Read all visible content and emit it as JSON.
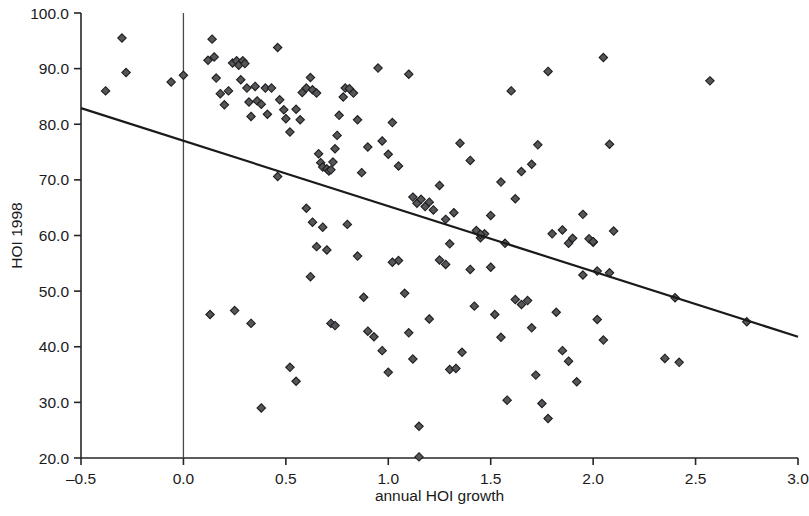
{
  "chart_data": {
    "type": "scatter",
    "title": "",
    "subtitle": "",
    "xlabel": "annual HOI growth",
    "ylabel": "HOI 1998",
    "xlim": [
      -0.5,
      3.0
    ],
    "ylim": [
      20.0,
      100.0
    ],
    "xticks": [
      -0.5,
      0.0,
      0.5,
      1.0,
      1.5,
      2.0,
      2.5,
      3.0
    ],
    "xticklabels": [
      "–0.5",
      "0.0",
      "0.5",
      "1.0",
      "1.5",
      "2.0",
      "2.5",
      "3.0"
    ],
    "yticks": [
      20.0,
      30.0,
      40.0,
      50.0,
      60.0,
      70.0,
      80.0,
      90.0,
      100.0
    ],
    "yticklabels": [
      "20.0",
      "30.0",
      "40.0",
      "50.0",
      "60.0",
      "70.0",
      "80.0",
      "90.0",
      "100.0"
    ],
    "grid": false,
    "legend": null,
    "legend_position": "none",
    "marker_shape": "diamond",
    "marker_color": "#55565a",
    "marker_edge_color": "#1d1d1f",
    "annotations": [
      {
        "name": "vertical-reference-line",
        "type": "vline",
        "x": 0.0,
        "color": "#4a4a4a"
      }
    ],
    "trendline": {
      "name": "linear-fit",
      "type": "line",
      "color": "#1a1a1a",
      "x": [
        -0.5,
        3.0
      ],
      "y": [
        82.9,
        41.8
      ],
      "slope": -11.74,
      "intercept": 77.03
    },
    "series": [
      {
        "name": "countries",
        "marker": "diamond",
        "points": [
          [
            -0.38,
            86.0
          ],
          [
            -0.3,
            95.5
          ],
          [
            -0.28,
            89.3
          ],
          [
            -0.06,
            87.6
          ],
          [
            0.0,
            88.8
          ],
          [
            0.12,
            91.5
          ],
          [
            0.14,
            95.3
          ],
          [
            0.15,
            92.1
          ],
          [
            0.16,
            88.3
          ],
          [
            0.18,
            85.5
          ],
          [
            0.2,
            83.5
          ],
          [
            0.22,
            86.0
          ],
          [
            0.24,
            91.0
          ],
          [
            0.26,
            91.4
          ],
          [
            0.27,
            90.6
          ],
          [
            0.28,
            88.0
          ],
          [
            0.29,
            91.4
          ],
          [
            0.3,
            90.9
          ],
          [
            0.31,
            86.5
          ],
          [
            0.32,
            84.0
          ],
          [
            0.33,
            81.4
          ],
          [
            0.35,
            86.8
          ],
          [
            0.36,
            84.2
          ],
          [
            0.38,
            83.6
          ],
          [
            0.4,
            86.5
          ],
          [
            0.41,
            81.8
          ],
          [
            0.43,
            86.5
          ],
          [
            0.46,
            93.8
          ],
          [
            0.47,
            84.4
          ],
          [
            0.49,
            82.6
          ],
          [
            0.5,
            81.0
          ],
          [
            0.52,
            78.6
          ],
          [
            0.55,
            82.7
          ],
          [
            0.57,
            80.8
          ],
          [
            0.58,
            85.7
          ],
          [
            0.6,
            86.5
          ],
          [
            0.62,
            88.4
          ],
          [
            0.63,
            86.2
          ],
          [
            0.65,
            85.6
          ],
          [
            0.66,
            74.7
          ],
          [
            0.67,
            73.1
          ],
          [
            0.68,
            72.3
          ],
          [
            0.7,
            72.0
          ],
          [
            0.71,
            71.6
          ],
          [
            0.72,
            71.8
          ],
          [
            0.73,
            73.2
          ],
          [
            0.74,
            75.6
          ],
          [
            0.75,
            78.0
          ],
          [
            0.76,
            81.6
          ],
          [
            0.78,
            84.9
          ],
          [
            0.79,
            86.5
          ],
          [
            0.81,
            86.4
          ],
          [
            0.83,
            85.6
          ],
          [
            0.85,
            80.8
          ],
          [
            0.87,
            71.3
          ],
          [
            0.9,
            75.9
          ],
          [
            0.95,
            90.1
          ],
          [
            0.97,
            77.0
          ],
          [
            1.0,
            74.6
          ],
          [
            1.02,
            80.3
          ],
          [
            1.05,
            72.5
          ],
          [
            1.1,
            89.0
          ],
          [
            1.12,
            66.9
          ],
          [
            1.14,
            65.8
          ],
          [
            1.16,
            66.5
          ],
          [
            1.18,
            65.2
          ],
          [
            1.2,
            66.0
          ],
          [
            1.22,
            64.6
          ],
          [
            1.25,
            69.0
          ],
          [
            1.28,
            62.9
          ],
          [
            1.32,
            64.1
          ],
          [
            1.35,
            76.6
          ],
          [
            1.4,
            73.5
          ],
          [
            1.43,
            60.9
          ],
          [
            1.45,
            59.6
          ],
          [
            1.47,
            60.3
          ],
          [
            1.5,
            63.6
          ],
          [
            1.55,
            69.6
          ],
          [
            1.57,
            58.6
          ],
          [
            1.6,
            86.0
          ],
          [
            1.62,
            66.6
          ],
          [
            1.65,
            71.5
          ],
          [
            1.7,
            72.8
          ],
          [
            1.73,
            76.3
          ],
          [
            1.78,
            89.5
          ],
          [
            1.8,
            60.3
          ],
          [
            1.85,
            61.0
          ],
          [
            1.88,
            58.6
          ],
          [
            1.9,
            59.5
          ],
          [
            1.95,
            63.8
          ],
          [
            2.0,
            58.8
          ],
          [
            2.02,
            53.6
          ],
          [
            2.05,
            92.0
          ],
          [
            2.08,
            76.4
          ],
          [
            2.1,
            60.8
          ],
          [
            2.4,
            48.8
          ],
          [
            2.57,
            87.8
          ],
          [
            2.75,
            44.5
          ],
          [
            0.13,
            45.8
          ],
          [
            0.25,
            46.5
          ],
          [
            0.33,
            44.2
          ],
          [
            0.38,
            29.0
          ],
          [
            0.52,
            36.3
          ],
          [
            0.55,
            33.8
          ],
          [
            0.62,
            52.6
          ],
          [
            0.63,
            62.4
          ],
          [
            0.65,
            58.0
          ],
          [
            0.68,
            61.5
          ],
          [
            0.7,
            57.4
          ],
          [
            0.72,
            44.2
          ],
          [
            0.74,
            43.8
          ],
          [
            0.8,
            62.0
          ],
          [
            0.85,
            56.3
          ],
          [
            0.88,
            48.9
          ],
          [
            0.9,
            42.8
          ],
          [
            0.93,
            41.8
          ],
          [
            0.97,
            39.3
          ],
          [
            1.0,
            35.4
          ],
          [
            1.05,
            55.5
          ],
          [
            1.08,
            49.6
          ],
          [
            1.1,
            42.5
          ],
          [
            1.12,
            37.8
          ],
          [
            1.15,
            25.7
          ],
          [
            1.15,
            20.2
          ],
          [
            1.2,
            45.0
          ],
          [
            1.25,
            55.6
          ],
          [
            1.28,
            54.8
          ],
          [
            1.3,
            35.9
          ],
          [
            1.33,
            36.1
          ],
          [
            1.36,
            39.0
          ],
          [
            1.4,
            53.9
          ],
          [
            1.42,
            47.3
          ],
          [
            1.45,
            60.2
          ],
          [
            1.5,
            54.3
          ],
          [
            1.52,
            45.8
          ],
          [
            1.55,
            41.7
          ],
          [
            1.58,
            30.4
          ],
          [
            1.62,
            48.5
          ],
          [
            1.65,
            47.6
          ],
          [
            1.68,
            48.3
          ],
          [
            1.7,
            43.4
          ],
          [
            1.72,
            34.9
          ],
          [
            1.75,
            29.8
          ],
          [
            1.78,
            27.1
          ],
          [
            1.82,
            46.2
          ],
          [
            1.85,
            39.3
          ],
          [
            1.88,
            37.4
          ],
          [
            1.92,
            33.7
          ],
          [
            1.95,
            52.9
          ],
          [
            1.98,
            59.4
          ],
          [
            2.0,
            58.9
          ],
          [
            2.02,
            44.9
          ],
          [
            2.05,
            41.2
          ],
          [
            2.08,
            53.3
          ],
          [
            2.35,
            37.9
          ],
          [
            2.42,
            37.2
          ],
          [
            0.46,
            70.6
          ],
          [
            1.02,
            55.2
          ],
          [
            1.3,
            58.5
          ],
          [
            0.6,
            64.9
          ]
        ]
      }
    ]
  },
  "figure": {
    "name": "scatter-plot-hoi"
  }
}
